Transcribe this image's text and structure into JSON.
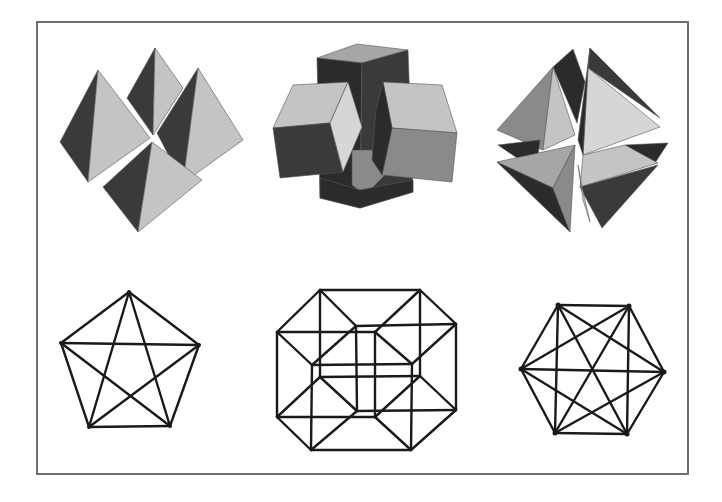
{
  "plate": {
    "background": "#ffffff",
    "frame": {
      "x": 37,
      "y": 22,
      "width": 651,
      "height": 452,
      "color": "#6f6f6f"
    }
  },
  "figures": {
    "top_row": [
      {
        "name": "compound-of-tetrahedra-cluster",
        "description": "Four shaded tetrahedra arranged around a common point"
      },
      {
        "name": "interlocking-prisms",
        "description": "Vertical square prism pierced by two horizontal rhombic prisms"
      },
      {
        "name": "stellated-tetrahedra-compound",
        "description": "Split compound of shaded tetrahedral wedges"
      }
    ],
    "bottom_row": [
      {
        "name": "complete-graph-k5",
        "vertices": 5,
        "edges": 10,
        "description": "Pentagon with pentagram (K5)"
      },
      {
        "name": "tesseract-projection",
        "vertices": 16,
        "edges": 32,
        "description": "Wireframe projection of a hypercube"
      },
      {
        "name": "complete-graph-k6",
        "vertices": 6,
        "edges": 15,
        "description": "Hexagon with all diagonals (K6)"
      }
    ]
  },
  "geometry": {
    "k5": [
      [
        129,
        292
      ],
      [
        199,
        345
      ],
      [
        170,
        426
      ],
      [
        89,
        427
      ],
      [
        61,
        343
      ]
    ],
    "k6": [
      [
        558,
        305
      ],
      [
        629,
        306
      ],
      [
        664,
        372
      ],
      [
        627,
        434
      ],
      [
        555,
        433
      ],
      [
        521,
        369
      ]
    ],
    "tesseract": {
      "A": [
        320,
        290
      ],
      "E": [
        420,
        290
      ],
      "B": [
        277,
        332
      ],
      "C": [
        356,
        326
      ],
      "G": [
        375,
        332
      ],
      "F": [
        456,
        324
      ],
      "D": [
        312,
        365
      ],
      "H": [
        412,
        364
      ],
      "I": [
        320,
        377
      ],
      "M": [
        420,
        376
      ],
      "J": [
        277,
        417
      ],
      "K": [
        357,
        411
      ],
      "O": [
        375,
        417
      ],
      "N": [
        456,
        410
      ],
      "L": [
        311,
        450
      ],
      "P": [
        411,
        450
      ]
    }
  }
}
